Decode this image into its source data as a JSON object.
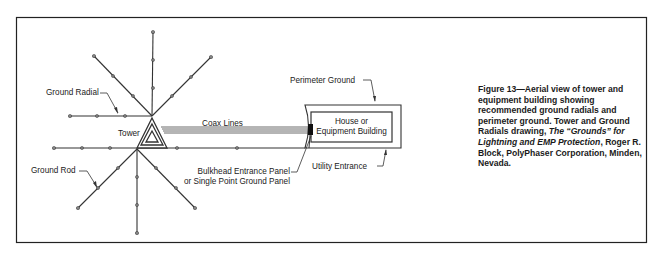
{
  "labels": {
    "ground_radial": "Ground Radial",
    "ground_rod": "Ground Rod",
    "tower": "Tower",
    "coax_lines": "Coax Lines",
    "perimeter_ground": "Perimeter Ground",
    "building_line1": "House or",
    "building_line2": "Equipment Building",
    "bulkhead_line1": "Bulkhead Entrance Panel",
    "bulkhead_line2": "or Single Point Ground Panel",
    "utility_entrance": "Utility Entrance"
  },
  "caption": {
    "part1": "Figure 13—Aerial view of tower and equipment building showing recommended ground radials and perimeter ground. Tower and Ground Radials drawing, ",
    "italic": "The “Grounds” for Lightning and EMP Protection",
    "part2": ", Roger R. Block, PolyPhaser Corporation, Minden, Nevada."
  },
  "colors": {
    "line": "#333333",
    "frame": "#222222"
  }
}
